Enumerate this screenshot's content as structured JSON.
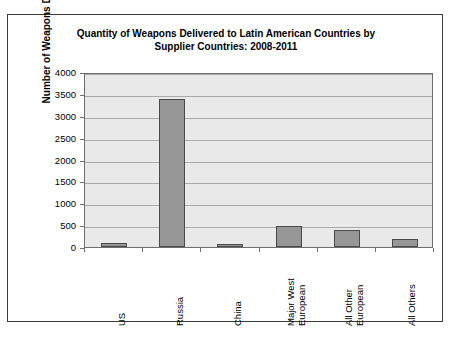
{
  "chart_data": {
    "type": "bar",
    "title": "Quantity of Weapons Delivered to Latin American Countries by Supplier Countries: 2008-2011",
    "title_line1": "Quantity of Weapons Delivered to Latin American Countries by",
    "title_line2": "Supplier Countries: 2008-2011",
    "xlabel": "",
    "ylabel": "Number of Weapons Delivered",
    "ylim": [
      0,
      4000
    ],
    "ytick_labels": [
      "4000",
      "3500",
      "3000",
      "2500",
      "2000",
      "1500",
      "1000",
      "500",
      "0"
    ],
    "ytick_values": [
      4000,
      3500,
      3000,
      2500,
      2000,
      1500,
      1000,
      500,
      0
    ],
    "grid": true,
    "legend": false,
    "categories": [
      "US",
      "Russia",
      "China",
      "Major West European",
      "All Other European",
      "All Others"
    ],
    "category_lines": [
      [
        "US"
      ],
      [
        "Russia"
      ],
      [
        "China"
      ],
      [
        "Major West",
        "European"
      ],
      [
        "All Other",
        "European"
      ],
      [
        "All Others"
      ]
    ],
    "values": [
      100,
      3390,
      70,
      470,
      390,
      175
    ],
    "bar_color": "#969696",
    "bar_edge_color": "#4a4a4a",
    "plot_background": "#e9e9e9",
    "gridline_color": "#a8a8a8",
    "figure_border_color": "#3c3c3c"
  }
}
